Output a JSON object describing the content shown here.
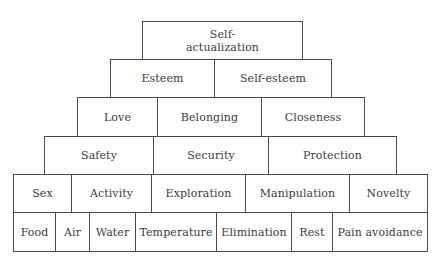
{
  "diagram": {
    "type": "hierarchy-pyramid",
    "levels": [
      {
        "level": 1,
        "items": [
          {
            "label": "Self-\nactualization",
            "line1": "Self-",
            "line2": "actualization",
            "width": 161
          }
        ]
      },
      {
        "level": 2,
        "items": [
          {
            "label": "Esteem",
            "width": 105
          },
          {
            "label": "Self-esteem",
            "width": 118
          }
        ]
      },
      {
        "level": 3,
        "items": [
          {
            "label": "Love",
            "width": 81
          },
          {
            "label": "Belonging",
            "width": 105
          },
          {
            "label": "Closeness",
            "width": 104
          }
        ]
      },
      {
        "level": 4,
        "items": [
          {
            "label": "Safety",
            "width": 110
          },
          {
            "label": "Security",
            "width": 116
          },
          {
            "label": "Protection",
            "width": 129
          }
        ]
      },
      {
        "level": 5,
        "items": [
          {
            "label": "Sex",
            "width": 59
          },
          {
            "label": "Activity",
            "width": 81
          },
          {
            "label": "Exploration",
            "width": 95
          },
          {
            "label": "Manipulation",
            "width": 105
          },
          {
            "label": "Novelty",
            "width": 79
          }
        ]
      },
      {
        "level": 6,
        "items": [
          {
            "label": "Food",
            "width": 43
          },
          {
            "label": "Air",
            "width": 35
          },
          {
            "label": "Water",
            "width": 47
          },
          {
            "label": "Temperature",
            "width": 82
          },
          {
            "label": "Elimination",
            "width": 76
          },
          {
            "label": "Rest",
            "width": 42
          },
          {
            "label": "Pain avoidance",
            "width": 96
          }
        ]
      }
    ]
  },
  "colors": {
    "border": "#4a4a4a",
    "text": "#3a3a3a",
    "background": "#ffffff"
  }
}
